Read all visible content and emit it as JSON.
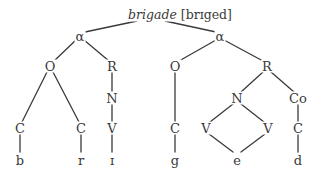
{
  "title": {
    "word": "brigade",
    "ipa": "[brɪged]"
  },
  "colors": {
    "line": "#3a3a3a",
    "text": "#3a3a3a",
    "background": "#ffffff"
  },
  "tree": {
    "syllables": [
      {
        "label": "α",
        "onset": {
          "label": "O",
          "children": [
            {
              "label": "C",
              "segment": "b"
            },
            {
              "label": "C",
              "segment": "r"
            }
          ]
        },
        "rhyme": {
          "label": "R",
          "nucleus": {
            "label": "N",
            "children": [
              {
                "label": "V",
                "segment": "ɪ"
              }
            ]
          }
        }
      },
      {
        "label": "α",
        "onset": {
          "label": "O",
          "children": [
            {
              "label": "C",
              "segment": "g"
            }
          ]
        },
        "rhyme": {
          "label": "R",
          "nucleus": {
            "label": "N",
            "children": [
              {
                "label": "V"
              },
              {
                "label": "V"
              }
            ],
            "shared_segment": "e"
          },
          "coda": {
            "label": "Co",
            "children": [
              {
                "label": "C",
                "segment": "d"
              }
            ]
          }
        }
      }
    ]
  }
}
